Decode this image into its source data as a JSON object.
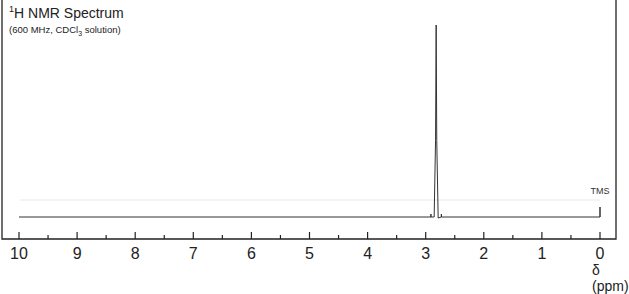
{
  "chart_data": {
    "type": "line",
    "title": "1H NMR Spectrum",
    "title_parts": {
      "sup": "1",
      "main": "H NMR Spectrum"
    },
    "subtitle": "(600 MHz, CDCl3 solution)",
    "subtitle_parts": {
      "pre": "(600 MHz, CDCl",
      "sub": "3",
      "post": " solution)"
    },
    "xlabel": "δ (ppm)",
    "ylabel": "",
    "xlim": [
      10,
      0
    ],
    "x_reversed": true,
    "xticks_major": [
      10,
      9,
      8,
      7,
      6,
      5,
      4,
      3,
      2,
      1,
      0
    ],
    "xticks_minor": [
      9.5,
      8.5,
      7.5,
      6.5,
      5.5,
      4.5,
      3.5,
      2.5,
      1.5,
      0.5
    ],
    "grid": false,
    "baseline_range_ppm": [
      10,
      0
    ],
    "peaks": [
      {
        "ppm": 2.82,
        "relative_intensity": 1.0,
        "multiplicity": "singlet",
        "satellites": [
          2.91,
          2.73
        ]
      },
      {
        "ppm": 0.0,
        "relative_intensity": 0.05,
        "label": "TMS"
      }
    ],
    "annotations": [
      {
        "text": "TMS",
        "ppm": 0.0
      }
    ],
    "integral_line": {
      "visible": true,
      "color": "#e6e6e6"
    }
  },
  "labels": {
    "title_sup": "1",
    "title_main": "H NMR Spectrum",
    "subtitle_pre": "(600 MHz, CDCl",
    "subtitle_sub": "3",
    "subtitle_post": " solution)",
    "xlabel": "δ (ppm)",
    "tms": "TMS",
    "ticks": [
      "10",
      "9",
      "8",
      "7",
      "6",
      "5",
      "4",
      "3",
      "2",
      "1",
      "0"
    ]
  },
  "colors": {
    "line": "#333333",
    "frame": "#222222",
    "integral": "#e6e6e6"
  }
}
